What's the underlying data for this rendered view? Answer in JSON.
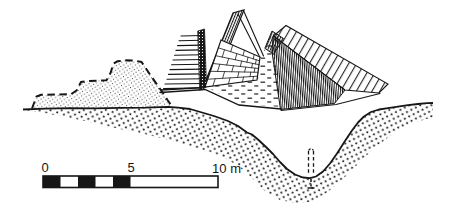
{
  "figure": {
    "background_color": "#ffffff",
    "ink_color": "#161616"
  },
  "scale_bar": {
    "unit": "m",
    "length_m": 10,
    "tick_values": [
      0,
      5,
      10
    ],
    "labels": {
      "zero": "0",
      "five": "5",
      "ten": "10 m"
    },
    "segment_fill_pattern": [
      "black",
      "white",
      "black",
      "white",
      "black",
      "white"
    ],
    "colors": {
      "filled": "#161616",
      "empty": "#ffffff"
    }
  }
}
